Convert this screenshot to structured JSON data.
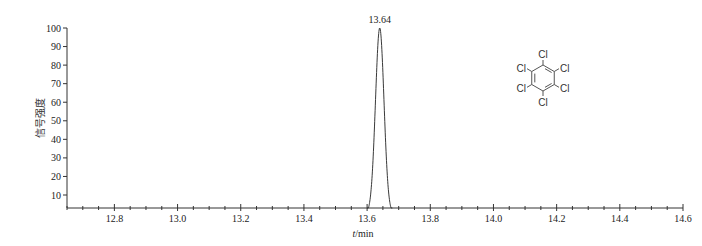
{
  "chart_data": {
    "type": "line",
    "title": "",
    "xlabel": "t/min",
    "xlabel_italic_part": "t",
    "xlabel_unit": "/min",
    "ylabel": "信号强度",
    "xlim": [
      12.65,
      14.6
    ],
    "ylim": [
      3,
      100
    ],
    "x_ticks": [
      12.8,
      13.0,
      13.2,
      13.4,
      13.6,
      13.8,
      14.0,
      14.2,
      14.4,
      14.6
    ],
    "x_tick_labels": [
      "12.8",
      "13.0",
      "13.2",
      "13.4",
      "13.6",
      "13.8",
      "14.0",
      "14.2",
      "14.4",
      "14.6"
    ],
    "y_ticks": [
      10,
      20,
      30,
      40,
      50,
      60,
      70,
      80,
      90,
      100
    ],
    "y_tick_labels": [
      "10",
      "20",
      "30",
      "40",
      "50",
      "60",
      "70",
      "80",
      "90",
      "100"
    ],
    "grid": false,
    "legend": null,
    "series": [
      {
        "name": "hexachlorobenzene",
        "peak": {
          "x": 13.64,
          "y": 100,
          "label": "13.64"
        },
        "x": [
          13.6,
          13.61,
          13.62,
          13.63,
          13.635,
          13.64,
          13.645,
          13.65,
          13.66,
          13.67,
          13.68
        ],
        "y": [
          0,
          12,
          45,
          88,
          97,
          100,
          97,
          88,
          45,
          12,
          0
        ]
      }
    ],
    "annotations": [
      {
        "text": "13.64",
        "x": 13.64,
        "y": 100,
        "position": "above-peak"
      }
    ],
    "inset": {
      "type": "chemical-structure",
      "compound": "hexachlorobenzene",
      "substituent_labels": [
        "Cl",
        "Cl",
        "Cl",
        "Cl",
        "Cl",
        "Cl"
      ]
    }
  }
}
